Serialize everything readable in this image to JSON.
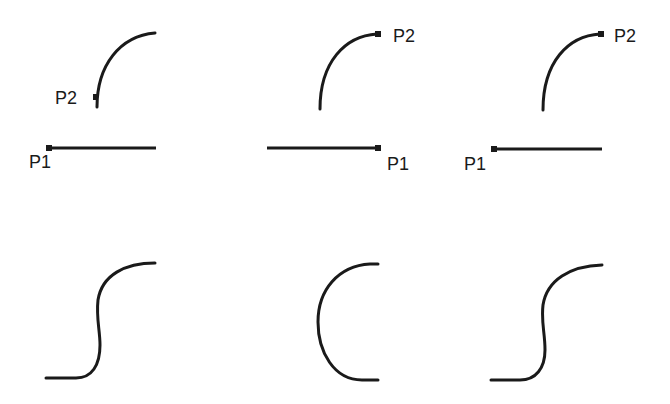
{
  "figure": {
    "stroke_color": "#1a1a1a",
    "background": "#ffffff",
    "panels": [
      {
        "id": "top-left",
        "labels": {
          "p1": "P1",
          "p2": "P2"
        },
        "elements": [
          "quarter-arc",
          "horizontal-line"
        ],
        "p1_position": "left end of line",
        "p2_position": "bottom end of arc"
      },
      {
        "id": "top-middle",
        "labels": {
          "p1": "P1",
          "p2": "P2"
        },
        "elements": [
          "quarter-arc",
          "horizontal-line"
        ],
        "p1_position": "right end of line",
        "p2_position": "top end of arc"
      },
      {
        "id": "top-right",
        "labels": {
          "p1": "P1",
          "p2": "P2"
        },
        "elements": [
          "quarter-arc",
          "horizontal-line"
        ],
        "p1_position": "left end of line",
        "p2_position": "top end of arc"
      },
      {
        "id": "bottom-left",
        "elements": [
          "s-curve"
        ]
      },
      {
        "id": "bottom-middle",
        "elements": [
          "c-curve"
        ]
      },
      {
        "id": "bottom-right",
        "elements": [
          "s-curve"
        ]
      }
    ]
  }
}
